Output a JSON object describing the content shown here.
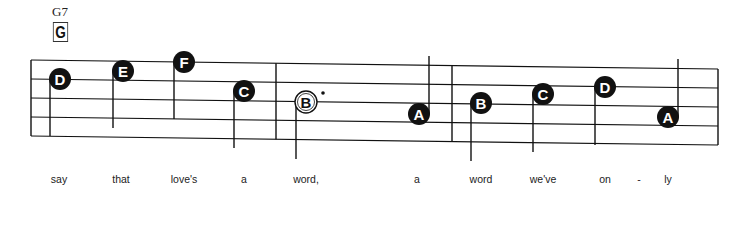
{
  "chord": {
    "name": "G7",
    "symbol": "G"
  },
  "staff": {
    "left_x": 31,
    "right_x": 718,
    "top_left_y": 60,
    "top_right_y": 69,
    "line_spacing": 19,
    "line_count": 5,
    "barlines_x": [
      276,
      452
    ],
    "colors": {
      "ink": "#111111",
      "paper": "#ffffff"
    }
  },
  "notes": [
    {
      "letter": "D",
      "x": 60,
      "y": 79,
      "filled": true,
      "stem": "down-left",
      "stem_end": 136,
      "lyric": "say"
    },
    {
      "letter": "E",
      "x": 123,
      "y": 71,
      "filled": true,
      "stem": "down-left",
      "stem_end": 128,
      "lyric": "that"
    },
    {
      "letter": "F",
      "x": 184,
      "y": 62,
      "filled": true,
      "stem": "down-left",
      "stem_end": 119,
      "lyric": "love's"
    },
    {
      "letter": "C",
      "x": 244,
      "y": 91,
      "filled": true,
      "stem": "down-left",
      "stem_end": 148,
      "lyric": "a"
    },
    {
      "letter": "B",
      "x": 306,
      "y": 102,
      "filled": false,
      "dotted": true,
      "stem": "down-left",
      "stem_end": 159,
      "lyric": "word,"
    },
    {
      "letter": "A",
      "x": 419,
      "y": 114,
      "filled": true,
      "stem": "up-right",
      "stem_end": 56,
      "lyric": "a"
    },
    {
      "letter": "B",
      "x": 481,
      "y": 103,
      "filled": true,
      "stem": "down-left",
      "stem_end": 161,
      "lyric": "word"
    },
    {
      "letter": "C",
      "x": 543,
      "y": 94,
      "filled": true,
      "stem": "down-left",
      "stem_end": 152,
      "lyric": "we've"
    },
    {
      "letter": "D",
      "x": 605,
      "y": 87,
      "filled": true,
      "stem": "down-left",
      "stem_end": 145,
      "lyric": "on"
    },
    {
      "letter": "A",
      "x": 668,
      "y": 117,
      "filled": true,
      "stem": "up-right",
      "stem_end": 59,
      "lyric": "ly"
    }
  ],
  "lyrics": [
    {
      "text": "say",
      "x": 59
    },
    {
      "text": "that",
      "x": 121
    },
    {
      "text": "love's",
      "x": 184
    },
    {
      "text": "a",
      "x": 244
    },
    {
      "text": "word,",
      "x": 306
    },
    {
      "text": "a",
      "x": 417
    },
    {
      "text": "word",
      "x": 481
    },
    {
      "text": "we've",
      "x": 543
    },
    {
      "text": "on",
      "x": 605
    },
    {
      "text": "-",
      "x": 639
    },
    {
      "text": "ly",
      "x": 668
    }
  ]
}
